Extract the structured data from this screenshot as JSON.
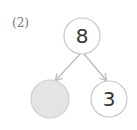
{
  "problem": {
    "label": "(2)",
    "whole": "8",
    "parts": [
      {
        "value": "",
        "shaded": true
      },
      {
        "value": "3",
        "shaded": false
      }
    ]
  },
  "colors": {
    "circle_stroke": "#c8c8c8",
    "shaded_fill": "#e4e4e4",
    "arrow": "#b8b8b8",
    "text": "#333333"
  }
}
